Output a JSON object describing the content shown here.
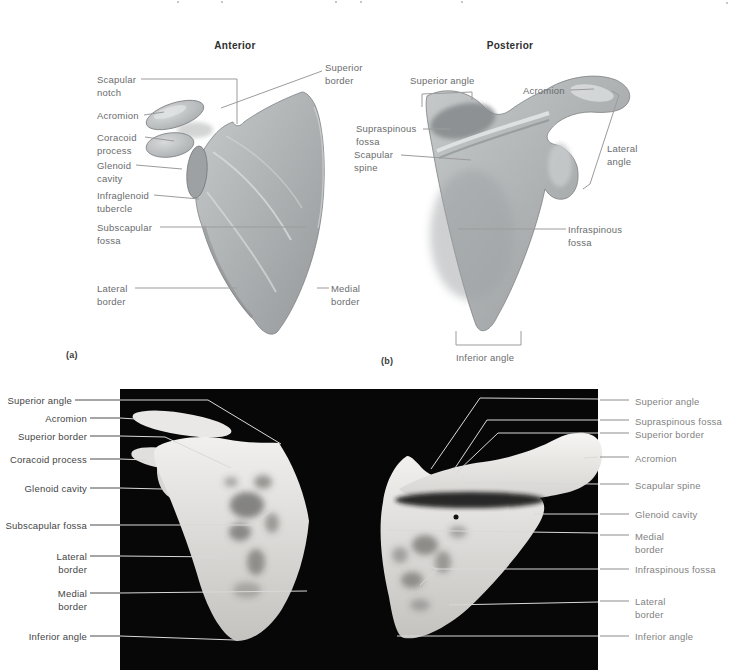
{
  "figure_type": "anatomy-diagram-scapula",
  "panel_a": {
    "title": "Anterior",
    "panel_letter": "(a)",
    "labels": {
      "scapular_notch": "Scapular\nnotch",
      "acromion": "Acromion",
      "superior_border": "Superior\nborder",
      "coracoid_process": "Coracoid\nprocess",
      "glenoid_cavity": "Glenoid\ncavity",
      "infraglenoid_tubercle": "Infraglenoid\ntubercle",
      "subscapular_fossa": "Subscapular\nfossa",
      "lateral_border": "Lateral\nborder",
      "medial_border": "Medial\nborder"
    }
  },
  "panel_b": {
    "title": "Posterior",
    "panel_letter": "(b)",
    "labels": {
      "superior_angle": "Superior angle",
      "acromion": "Acromion",
      "supraspinous_fossa": "Supraspinous\nfossa",
      "scapular_spine": "Scapular\nspine",
      "lateral_angle": "Lateral\nangle",
      "infraspinous_fossa": "Infraspinous\nfossa",
      "inferior_angle": "Inferior angle"
    }
  },
  "photo_left": {
    "view": "anterior photograph",
    "labels": [
      "Superior angle",
      "Acromion",
      "Superior border",
      "Coracoid process",
      "Glenoid cavity",
      "Subscapular fossa",
      "Lateral\nborder",
      "Medial\nborder",
      "Inferior angle"
    ]
  },
  "photo_right": {
    "view": "posterior photograph",
    "labels": [
      "Superior angle",
      "Supraspinous fossa",
      "Superior border",
      "Acromion",
      "Scapular spine",
      "Glenoid cavity",
      "Medial\nborder",
      "Infraspinous fossa",
      "Lateral\nborder",
      "Inferior angle"
    ]
  },
  "colors": {
    "background": "#ffffff",
    "photo_background": "#070707",
    "illustration_label": "#6a6c6e",
    "photo_left_label": "#454545",
    "photo_right_label": "#828282",
    "leader_gray": "#9b9b9b",
    "leader_dark": "#4c4c4c",
    "leader_light": "#d9d9d9",
    "bone_illustration": "#aab0b2",
    "bone_photo": "#e5e4e1"
  }
}
